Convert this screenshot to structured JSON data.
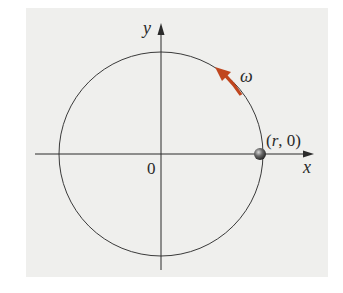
{
  "diagram": {
    "labels": {
      "y_axis": "y",
      "x_axis": "x",
      "origin": "0",
      "omega": "ω",
      "point": "(r, 0)"
    },
    "colors": {
      "background_panel": "#efefed",
      "axes": "#2b2b2b",
      "circle": "#3a3a3a",
      "omega_arrow": "#c0461e",
      "particle": "#4a4a4a"
    },
    "rotation_direction": "counterclockwise"
  }
}
